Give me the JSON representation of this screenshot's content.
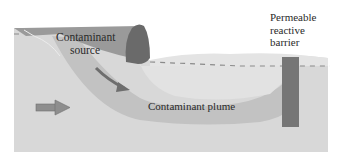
{
  "diagram": {
    "labels": {
      "source_line1": "Contaminant",
      "source_line2": "source",
      "plume": "Contaminant plume",
      "barrier_line1": "Permeable",
      "barrier_line2": "reactive",
      "barrier_line3": "barrier"
    },
    "colors": {
      "background": "#ffffff",
      "ground": "#d8d8d8",
      "ground_upper": "#e4e4e4",
      "source_zone": "#9a9a9a",
      "plume": "#c2c2c2",
      "plume_inner": "#e2e2e2",
      "boulder": "#6a6a6a",
      "barrier": "#767676",
      "water_table": "#8a8a8a",
      "flow_arrow": "#8e8e8e",
      "migration_arrow": "#6e6e6e"
    },
    "icons": {
      "groundwater_flow": "right-arrow-icon",
      "contaminant_migration": "diagonal-arrow-icon"
    }
  }
}
